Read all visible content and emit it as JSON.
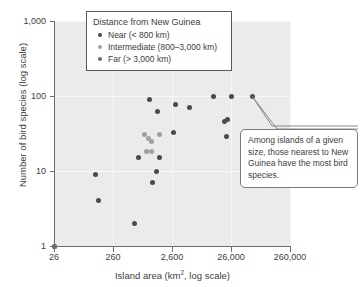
{
  "chart_data": {
    "type": "scatter",
    "title": "",
    "xlabel": "Island area (km2, log scale)",
    "xlabel_base": "Island area (km",
    "xlabel_sup": "2",
    "xlabel_tail": ", log scale)",
    "ylabel": "Number of bird species (log scale)",
    "xscale": "log",
    "yscale": "log",
    "xlim": [
      26,
      260000
    ],
    "ylim": [
      1,
      1000
    ],
    "grid": true,
    "xticks": [
      26,
      260,
      2600,
      26000,
      260000
    ],
    "xticklabels": [
      "26",
      "260",
      "2,600",
      "26,000",
      "260,000"
    ],
    "yticks": [
      1,
      10,
      100,
      1000
    ],
    "yticklabels": [
      "1",
      "10",
      "100",
      "1,000"
    ],
    "legend_position": "top-center",
    "legend_title": "Distance from New Guinea",
    "series": [
      {
        "name": "Near (< 800 km)",
        "key": "near",
        "color": "#4a4a4a",
        "points": [
          [
            26,
            1
          ],
          [
            1100,
            90
          ],
          [
            1500,
            62
          ],
          [
            3000,
            78
          ],
          [
            5200,
            70
          ],
          [
            2800,
            33
          ],
          [
            13000,
            99
          ],
          [
            26000,
            99
          ],
          [
            60000,
            100
          ],
          [
            20000,
            46
          ],
          [
            23000,
            49
          ],
          [
            22000,
            29
          ],
          [
            700,
            15
          ],
          [
            1600,
            15
          ],
          [
            1400,
            10
          ],
          [
            1200,
            7
          ],
          [
            600,
            2
          ],
          [
            150,
            4
          ],
          [
            130,
            9
          ]
        ]
      },
      {
        "name": "Intermediate (800–3,000 km)",
        "key": "intermediate",
        "color": "#a0a0a0",
        "points": [
          [
            900,
            31
          ],
          [
            1050,
            27
          ],
          [
            1150,
            25
          ],
          [
            1600,
            31
          ],
          [
            950,
            18
          ],
          [
            1150,
            18
          ],
          [
            26,
            1
          ]
        ]
      },
      {
        "name": "Far (> 3,000 km)",
        "key": "far",
        "color": "#6b6b6b",
        "points": [
          [
            26,
            1
          ]
        ]
      }
    ],
    "annotations": [
      {
        "text": "Among islands of a given size, those nearest to New Guinea have the most bird species.",
        "target": [
          26000,
          99
        ]
      }
    ]
  },
  "legend": {
    "title": "Distance from New Guinea",
    "items": [
      {
        "label": "Near (< 800 km)",
        "key": "near"
      },
      {
        "label": "Intermediate (800–3,000 km)",
        "key": "intermediate"
      },
      {
        "label": "Far (> 3,000 km)",
        "key": "far"
      }
    ]
  },
  "callout": {
    "text": "Among islands of a given size, those nearest to New Guinea have the most bird species."
  },
  "colors": {
    "plot_background": "#ebebeb",
    "gridline": "#f7f7f7",
    "axis": "#6e6e6e",
    "text": "#3d3d3d",
    "near": "#4a4a4a",
    "intermediate": "#a0a0a0",
    "far": "#6b6b6b"
  }
}
